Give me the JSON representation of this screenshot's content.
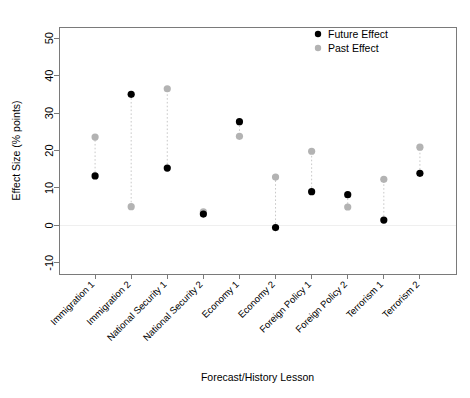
{
  "chart_data": {
    "type": "scatter",
    "title": "",
    "xlabel": "Forecast/History Lesson",
    "ylabel": "Effect Size (% points)",
    "ylim": [
      -13,
      53
    ],
    "yticks": [
      -10,
      0,
      10,
      20,
      30,
      40,
      50
    ],
    "ytick_labels": [
      "-10",
      "0",
      "10",
      "20",
      "30",
      "40",
      "50"
    ],
    "grid": false,
    "zero_reference_line": true,
    "legend_position": "top-right",
    "categories": [
      "Immigration 1",
      "Immigration 2",
      "National Security 1",
      "National Security 2",
      "Economy 1",
      "Economy 2",
      "Foreign Policy 1",
      "Foreign Policy 2",
      "Terrorism 1",
      "Terrorism 2"
    ],
    "series": [
      {
        "name": "Future Effect",
        "color": "#000000",
        "values": [
          13.2,
          35.0,
          15.3,
          3.0,
          27.7,
          -0.6,
          9.0,
          8.2,
          1.4,
          13.9
        ]
      },
      {
        "name": "Past Effect",
        "color": "#b3b3b3",
        "values": [
          23.6,
          5.0,
          36.5,
          3.6,
          23.8,
          12.9,
          19.8,
          4.9,
          12.3,
          20.9
        ]
      }
    ],
    "connector_color": "#c8c8c8"
  },
  "legend": {
    "entries": [
      {
        "label": "Future Effect",
        "marker_color": "#000000"
      },
      {
        "label": "Past Effect",
        "marker_color": "#b3b3b3"
      }
    ]
  },
  "axes": {
    "y_title": "Effect Size (% points)",
    "x_title": "Forecast/History Lesson"
  }
}
